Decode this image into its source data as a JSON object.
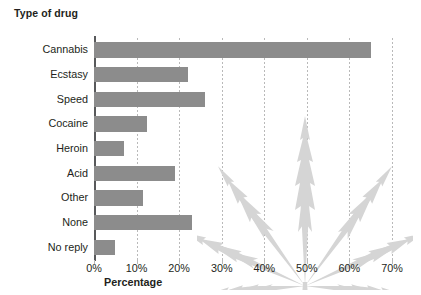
{
  "chart_data": {
    "type": "bar",
    "orientation": "horizontal",
    "title": "",
    "xlabel": "Percentage",
    "ylabel": "Type of drug",
    "categories": [
      "Cannabis",
      "Ecstasy",
      "Speed",
      "Cocaine",
      "Heroin",
      "Acid",
      "Other",
      "None",
      "No reply"
    ],
    "values": [
      65,
      22,
      26,
      12.5,
      7,
      19,
      11.5,
      23,
      5
    ],
    "xlim": [
      0,
      70
    ],
    "xtick_labels": [
      "0%",
      "10%",
      "20%",
      "30%",
      "40%",
      "50%",
      "60%",
      "70%"
    ],
    "xticks": [
      0,
      10,
      20,
      30,
      40,
      50,
      60,
      70
    ],
    "grid": "vertical-dotted",
    "legend": "none",
    "bar_color": "#8c8c8c",
    "gridline_color": "#b9b9b9",
    "axis_color": "#58595b",
    "background_color": "#ffffff",
    "watermark": {
      "name": "cannabis-leaf",
      "color": "#d5d5d5"
    }
  },
  "axis_titles": {
    "y": "Type of drug",
    "x": "Percentage"
  }
}
